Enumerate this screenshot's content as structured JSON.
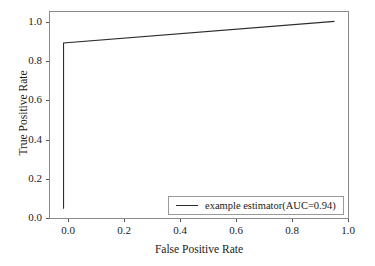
{
  "chart_data": {
    "type": "line",
    "title": "",
    "xlabel": "False Positive Rate",
    "ylabel": "True Positive Rate",
    "xlim": [
      -0.05,
      1.05
    ],
    "ylim": [
      -0.05,
      1.05
    ],
    "grid": false,
    "legend_position": "lower right",
    "xticks": [
      "0.0",
      "0.2",
      "0.4",
      "0.6",
      "0.8",
      "1.0"
    ],
    "xtick_values": [
      0.0,
      0.2,
      0.4,
      0.6,
      0.8,
      1.0
    ],
    "yticks": [
      "0.0",
      "0.2",
      "0.4",
      "0.6",
      "0.8",
      "1.0"
    ],
    "ytick_values": [
      0.0,
      0.2,
      0.4,
      0.6,
      0.8,
      1.0
    ],
    "series": [
      {
        "name": "example estimator(AUC=0.94)",
        "auc": 0.94,
        "color": "#2b2b2b",
        "x": [
          0.0,
          0.0,
          1.0
        ],
        "y": [
          0.0,
          0.885,
          1.0
        ]
      }
    ]
  },
  "legend": {
    "entries": [
      {
        "label": "example estimator(AUC=0.94)"
      }
    ]
  }
}
